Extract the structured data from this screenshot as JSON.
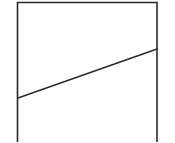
{
  "diagram": {
    "width": 175,
    "height": 142,
    "stroke_color": "#2a2a2a",
    "background": "#ffffff",
    "frame": {
      "left_x": 17.5,
      "right_x": 157,
      "top_y": 2.5,
      "bottom_y": 142,
      "stroke_width": 1.6,
      "open_bottom": true
    },
    "diagonal_line": {
      "x1": 18,
      "y1": 98,
      "x2": 157,
      "y2": 49,
      "stroke_width": 1.4
    }
  }
}
